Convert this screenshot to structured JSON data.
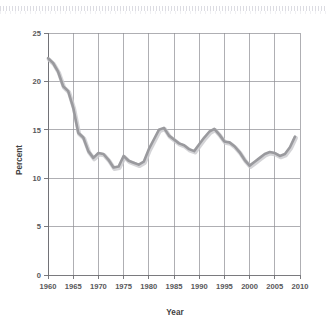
{
  "chart_data": {
    "type": "line",
    "title": "",
    "xlabel": "Year",
    "ylabel": "Percent",
    "xlim": [
      1960,
      2010
    ],
    "ylim": [
      0,
      25
    ],
    "grid": true,
    "legend": "none",
    "xticks": [
      "1960",
      "1965",
      "1970",
      "1975",
      "1980",
      "1985",
      "1990",
      "1995",
      "2000",
      "2005",
      "2010"
    ],
    "yticks": [
      "0",
      "5",
      "10",
      "15",
      "20",
      "25"
    ],
    "series": [
      {
        "name": "Percent",
        "x": [
          1960,
          1961,
          1962,
          1963,
          1964,
          1965,
          1966,
          1967,
          1968,
          1969,
          1970,
          1971,
          1972,
          1973,
          1974,
          1975,
          1976,
          1977,
          1978,
          1979,
          1980,
          1981,
          1982,
          1983,
          1984,
          1985,
          1986,
          1987,
          1988,
          1989,
          1990,
          1991,
          1992,
          1993,
          1994,
          1995,
          1996,
          1997,
          1998,
          1999,
          2000,
          2001,
          2002,
          2003,
          2004,
          2005,
          2006,
          2007,
          2008,
          2009
        ],
        "values": [
          22.4,
          21.9,
          21.0,
          19.5,
          19.0,
          17.3,
          14.7,
          14.2,
          12.8,
          12.1,
          12.6,
          12.5,
          11.9,
          11.1,
          11.2,
          12.3,
          11.8,
          11.6,
          11.4,
          11.7,
          13.0,
          14.0,
          15.0,
          15.2,
          14.4,
          14.0,
          13.6,
          13.4,
          13.0,
          12.8,
          13.5,
          14.2,
          14.8,
          15.1,
          14.5,
          13.8,
          13.7,
          13.3,
          12.7,
          11.9,
          11.3,
          11.7,
          12.1,
          12.5,
          12.7,
          12.6,
          12.3,
          12.5,
          13.2,
          14.3
        ]
      }
    ]
  },
  "labels": {
    "x_axis_title": "Year",
    "y_axis_title": "Percent"
  }
}
